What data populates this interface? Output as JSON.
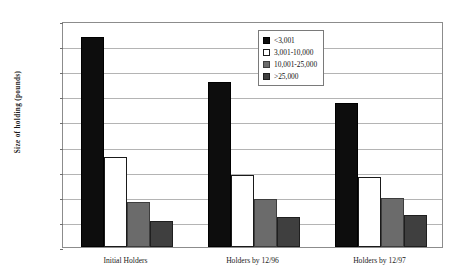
{
  "chart_data": {
    "type": "bar",
    "title": "",
    "xlabel": "",
    "ylabel": "Size of holding (pounds)",
    "categories": [
      "Initial Holders",
      "Holders by 12/96",
      "Holders by 12/97"
    ],
    "series": [
      {
        "name": "<3,001",
        "values": [
          4180,
          3290,
          2870
        ]
      },
      {
        "name": "3,001-10,000",
        "values": [
          1790,
          1440,
          1400
        ]
      },
      {
        "name": "10,001-25,000",
        "values": [
          890,
          960,
          980
        ]
      },
      {
        "name": ">25,000",
        "values": [
          520,
          600,
          640
        ]
      }
    ],
    "ylim": [
      0,
      4500
    ],
    "ytick_values": [
      0,
      500,
      1000,
      1500,
      2000,
      2500,
      3000,
      3500,
      4000,
      4500
    ],
    "ytick_labels": [
      "-",
      "500",
      "1,000",
      "1,500",
      "2,000",
      "2,500",
      "3,000",
      "3,500",
      "4,000",
      "4,500"
    ],
    "grid": true,
    "legend_position": "upper-center",
    "colors": {
      "series_0": "#0d0d0d",
      "series_1": "#ffffff",
      "series_2": "#6b6b6b",
      "series_3": "#3f3f3f",
      "gridline": "#b4b4b4",
      "frame": "#8c8c8c",
      "text": "#1a1a1a",
      "background": "#ffffff"
    }
  }
}
